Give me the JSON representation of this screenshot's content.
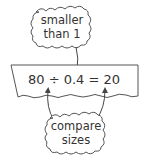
{
  "diagram": {
    "top_callout": {
      "line1": "smaller",
      "line2": "than 1"
    },
    "equation": "80 ÷ 0.4 = 20",
    "bottom_callout": {
      "line1": "compare",
      "line2": "sizes"
    }
  },
  "colors": {
    "stroke": "#555555",
    "text": "#333333",
    "background": "#ffffff"
  }
}
